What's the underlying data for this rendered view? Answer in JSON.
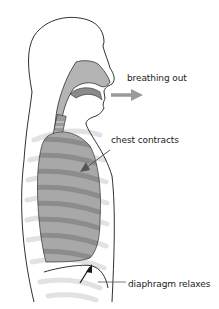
{
  "diagram": {
    "labels": {
      "breathing_out": "breathing out",
      "chest_contracts": "chest contracts",
      "diaphragm_relaxes": "diaphragm relaxes"
    },
    "colors": {
      "outline": "#1a1a1a",
      "airway_fill": "#b4b4b4",
      "lung_fill": "#a8a8a8",
      "lung_stripe": "#8c8c8c",
      "rib_shadow": "#e2e2e2",
      "arrow_gray": "#9a9a9a",
      "pointer": "#555555",
      "text": "#222222"
    }
  }
}
